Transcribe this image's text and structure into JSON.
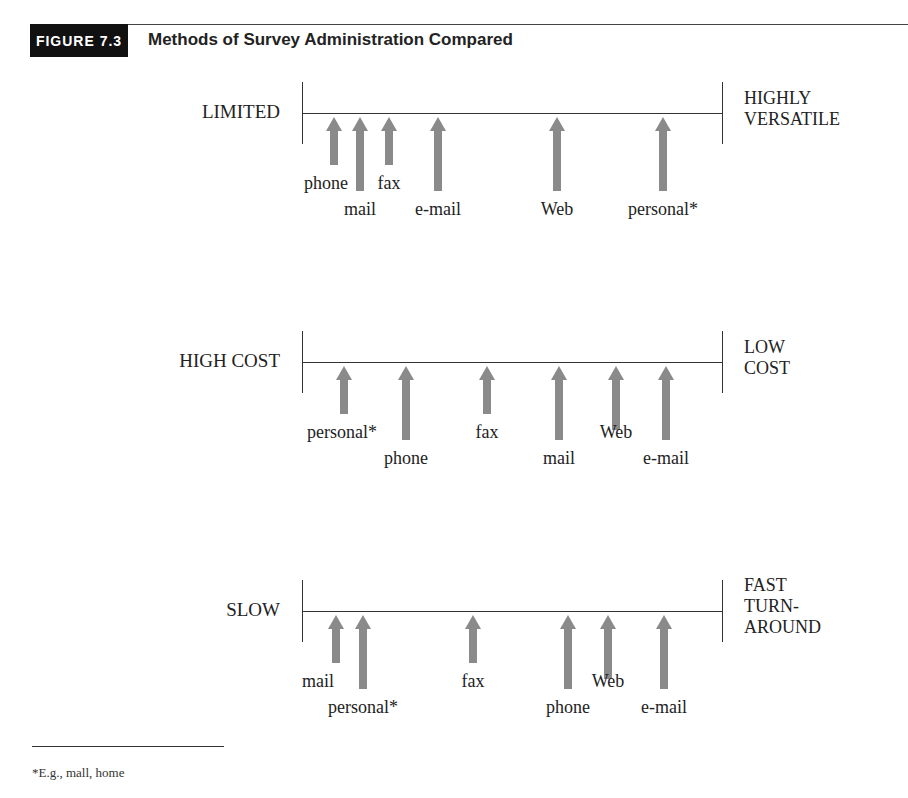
{
  "figure": {
    "number_label": "FIGURE 7.3",
    "title": "Methods of Survey Administration Compared"
  },
  "scales": [
    {
      "left_label": "LIMITED",
      "right_label": "HIGHLY\nVERSATILE",
      "line_y": 113,
      "items": [
        {
          "label": "phone",
          "x": 334,
          "len": "short",
          "label_row": 1,
          "label_dx": -8
        },
        {
          "label": "mail",
          "x": 360,
          "len": "long",
          "label_row": 2,
          "label_dx": 0
        },
        {
          "label": "fax",
          "x": 389,
          "len": "short",
          "label_row": 1,
          "label_dx": 0
        },
        {
          "label": "e-mail",
          "x": 438,
          "len": "long",
          "label_row": 2,
          "label_dx": 0
        },
        {
          "label": "Web",
          "x": 557,
          "len": "long",
          "label_row": 2,
          "label_dx": 0
        },
        {
          "label": "personal*",
          "x": 663,
          "len": "long",
          "label_row": 2,
          "label_dx": 0
        }
      ]
    },
    {
      "left_label": "HIGH COST",
      "right_label": "LOW\nCOST",
      "line_y": 362,
      "items": [
        {
          "label": "personal*",
          "x": 344,
          "len": "short",
          "label_row": 1,
          "label_dx": -2
        },
        {
          "label": "phone",
          "x": 406,
          "len": "long",
          "label_row": 2,
          "label_dx": 0
        },
        {
          "label": "fax",
          "x": 487,
          "len": "short",
          "label_row": 1,
          "label_dx": 0
        },
        {
          "label": "mail",
          "x": 559,
          "len": "long",
          "label_row": 2,
          "label_dx": 0
        },
        {
          "label": "Web",
          "x": 616,
          "len": "medium",
          "label_row": 1,
          "label_dx": 0
        },
        {
          "label": "e-mail",
          "x": 666,
          "len": "long",
          "label_row": 2,
          "label_dx": 0
        }
      ]
    },
    {
      "left_label": "SLOW",
      "right_label": "FAST\nTURN-\nAROUND",
      "line_y": 611,
      "items": [
        {
          "label": "mail",
          "x": 336,
          "len": "short",
          "label_row": 1,
          "label_dx": -18
        },
        {
          "label": "personal*",
          "x": 363,
          "len": "long",
          "label_row": 2,
          "label_dx": 0
        },
        {
          "label": "fax",
          "x": 473,
          "len": "short",
          "label_row": 1,
          "label_dx": 0
        },
        {
          "label": "phone",
          "x": 568,
          "len": "long",
          "label_row": 2,
          "label_dx": 0
        },
        {
          "label": "Web",
          "x": 608,
          "len": "medium",
          "label_row": 1,
          "label_dx": 0
        },
        {
          "label": "e-mail",
          "x": 664,
          "len": "long",
          "label_row": 2,
          "label_dx": 0
        }
      ]
    }
  ],
  "footnote": "*E.g., mall, home",
  "colors": {
    "arrow": "#8a8a8a",
    "figure_box": "#111111",
    "text": "#222222"
  }
}
